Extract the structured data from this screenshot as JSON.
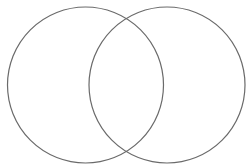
{
  "diagram": {
    "type": "venn",
    "background": "#ffffff",
    "stroke_color": "#6a6a6a",
    "stroke_width": 1.2,
    "circles": [
      {
        "id": "set-a",
        "label": "",
        "cx": 85.5,
        "cy": 85,
        "r": 78
      },
      {
        "id": "set-b",
        "label": "",
        "cx": 167,
        "cy": 85,
        "r": 78
      }
    ]
  }
}
